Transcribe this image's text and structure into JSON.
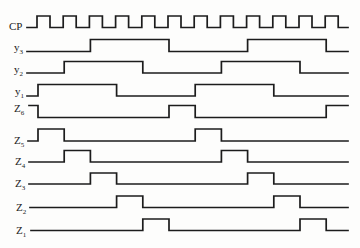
{
  "diagram": {
    "type": "timing-diagram",
    "clock": {
      "label": {
        "base": "CP",
        "sub": ""
      },
      "rising_edges": 12,
      "initial_level": 0
    },
    "signals": [
      {
        "id": "y3",
        "label": {
          "base": "y",
          "sub": "3"
        },
        "initial_level": 0,
        "toggles_at_clock": [
          2,
          5,
          8,
          11
        ]
      },
      {
        "id": "y2",
        "label": {
          "base": "y",
          "sub": "2"
        },
        "initial_level": 0,
        "toggles_at_clock": [
          1,
          4,
          7,
          10
        ]
      },
      {
        "id": "y1",
        "label": {
          "base": "y",
          "sub": "1"
        },
        "initial_level": 0,
        "toggles_at_clock": [
          0,
          3,
          6,
          9
        ]
      },
      {
        "id": "Z6",
        "label": {
          "base": "Z",
          "sub": "6"
        },
        "initial_level": 1,
        "toggles_at_clock": [
          0,
          5,
          6,
          11
        ]
      },
      {
        "id": "Z5",
        "label": {
          "base": "Z",
          "sub": "5"
        },
        "initial_level": 0,
        "toggles_at_clock": [
          0,
          1,
          6,
          7
        ]
      },
      {
        "id": "Z4",
        "label": {
          "base": "Z",
          "sub": "4"
        },
        "initial_level": 0,
        "toggles_at_clock": [
          1,
          2,
          7,
          8
        ]
      },
      {
        "id": "Z3",
        "label": {
          "base": "Z",
          "sub": "3"
        },
        "initial_level": 0,
        "toggles_at_clock": [
          2,
          3,
          8,
          9
        ]
      },
      {
        "id": "Z2",
        "label": {
          "base": "Z",
          "sub": "2"
        },
        "initial_level": 0,
        "toggles_at_clock": [
          3,
          4,
          9,
          10
        ]
      },
      {
        "id": "Z1",
        "label": {
          "base": "Z",
          "sub": "1"
        },
        "initial_level": 0,
        "toggles_at_clock": [
          4,
          5,
          10,
          11
        ]
      }
    ]
  }
}
